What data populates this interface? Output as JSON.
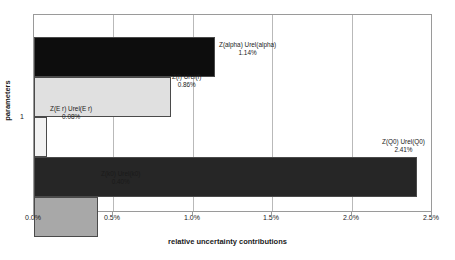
{
  "chart_data": {
    "type": "bar",
    "orientation": "horizontal",
    "title": "",
    "xlabel": "relative uncertainty contributions",
    "ylabel": "parameters",
    "xlim": [
      0,
      2.5
    ],
    "xunit": "%",
    "grid": true,
    "legend": false,
    "y_tick_labels": [
      "1"
    ],
    "x_tick_labels": [
      "0.0%",
      "0.5%",
      "1.0%",
      "1.5%",
      "2.0%",
      "2.5%"
    ],
    "x_tick_values": [
      0.0,
      0.5,
      1.0,
      1.5,
      2.0,
      2.5
    ],
    "categories": [
      "Z(alpha) Urel(alpha)",
      "Z(f) Urel(f)",
      "Z(E r) Urel(E r)",
      "Z(Q0) Urel(Q0)",
      "Z(k0) Urel(k0)"
    ],
    "values": [
      1.14,
      0.86,
      0.08,
      2.41,
      0.4
    ],
    "value_labels": [
      "1.14%",
      "0.86%",
      "0.08%",
      "2.41%",
      "0.40%"
    ],
    "colors": [
      "#0d0d0d",
      "#e0e0e0",
      "#f2f2f2",
      "#262626",
      "#a8a8a8"
    ],
    "bars": [
      {
        "name": "Z(alpha) Urel(alpha)",
        "value": 1.14,
        "value_label": "1.14%",
        "color": "#0d0d0d"
      },
      {
        "name": "Z(f) Urel(f)",
        "value": 0.86,
        "value_label": "0.86%",
        "color": "#e0e0e0"
      },
      {
        "name": "Z(E r) Urel(E r)",
        "value": 0.08,
        "value_label": "0.08%",
        "color": "#f2f2f2"
      },
      {
        "name": "Z(Q0) Urel(Q0)",
        "value": 2.41,
        "value_label": "2.41%",
        "color": "#262626"
      },
      {
        "name": "Z(k0) Urel(k0)",
        "value": 0.4,
        "value_label": "0.40%",
        "color": "#a8a8a8"
      }
    ]
  }
}
